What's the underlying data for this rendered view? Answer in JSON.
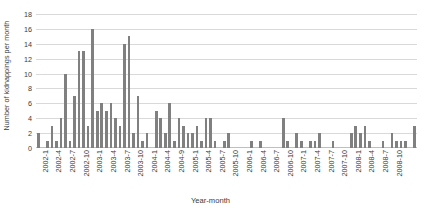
{
  "chart_data": {
    "type": "bar",
    "title": "",
    "xlabel": "Year-month",
    "ylabel": "Number of kidnappings per month",
    "ylim": [
      0,
      18
    ],
    "ytick_step": 2,
    "yticks": [
      0,
      2,
      4,
      6,
      8,
      10,
      12,
      14,
      16,
      18
    ],
    "grid": true,
    "legend": false,
    "bar_color": "#808080",
    "gridline_color": "#d9d9d9",
    "text_color": "#3a3a3a",
    "xtick_interval_months": 3,
    "xtick_labels": [
      "2002-1",
      "2002-4",
      "2002-7",
      "2002-10",
      "2003-1",
      "2003-4",
      "2003-7",
      "2003-10",
      "2004-1",
      "2004-4",
      "2004-9",
      "2005-1",
      "2005-4",
      "2005-7",
      "2005-10",
      "2006-1",
      "2006-4",
      "2006-7",
      "2006-10",
      "2007-1",
      "2007-4",
      "2007-7",
      "2007-10",
      "2008-1",
      "2008-4",
      "2008-7",
      "2008-10"
    ],
    "categories": [
      "2002-1",
      "2002-2",
      "2002-3",
      "2002-4",
      "2002-5",
      "2002-6",
      "2002-7",
      "2002-8",
      "2002-9",
      "2002-10",
      "2002-11",
      "2002-12",
      "2003-1",
      "2003-2",
      "2003-3",
      "2003-4",
      "2003-5",
      "2003-6",
      "2003-7",
      "2003-8",
      "2003-9",
      "2003-10",
      "2003-11",
      "2003-12",
      "2004-1",
      "2004-2",
      "2004-3",
      "2004-4",
      "2004-5",
      "2004-6",
      "2004-7",
      "2004-8",
      "2004-9",
      "2004-10",
      "2004-11",
      "2004-12",
      "2005-1",
      "2005-2",
      "2005-3",
      "2005-4",
      "2005-5",
      "2005-6",
      "2005-7",
      "2005-8",
      "2005-9",
      "2005-10",
      "2005-11",
      "2005-12",
      "2006-1",
      "2006-2",
      "2006-3",
      "2006-4",
      "2006-5",
      "2006-6",
      "2006-7",
      "2006-8",
      "2006-9",
      "2006-10",
      "2006-11",
      "2006-12",
      "2007-1",
      "2007-2",
      "2007-3",
      "2007-4",
      "2007-5",
      "2007-6",
      "2007-7",
      "2007-8",
      "2007-9",
      "2007-10",
      "2007-11",
      "2007-12",
      "2008-1",
      "2008-2",
      "2008-3",
      "2008-4",
      "2008-5",
      "2008-6",
      "2008-7",
      "2008-8",
      "2008-9",
      "2008-10",
      "2008-11",
      "2008-12"
    ],
    "values": [
      2,
      0,
      1,
      3,
      1,
      4,
      10,
      1,
      7,
      13,
      13,
      3,
      16,
      5,
      6,
      5,
      6,
      4,
      3,
      14,
      15,
      2,
      7,
      1,
      2,
      0,
      5,
      4,
      2,
      6,
      1,
      4,
      3,
      2,
      2,
      3,
      1,
      4,
      4,
      1,
      0,
      1,
      2,
      0,
      0,
      0,
      0,
      1,
      0,
      1,
      0,
      0,
      0,
      0,
      4,
      1,
      0,
      2,
      1,
      0,
      1,
      1,
      2,
      0,
      0,
      1,
      0,
      0,
      0,
      2,
      3,
      2,
      3,
      1,
      0,
      0,
      1,
      0,
      2,
      1,
      1,
      1,
      0,
      3
    ]
  }
}
